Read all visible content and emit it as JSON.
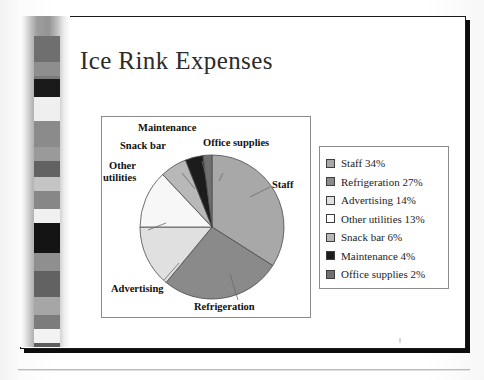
{
  "page": {
    "kind": "scanned-book-page",
    "slide_title": "Ice Rink Expenses"
  },
  "chart_data": {
    "type": "pie",
    "title": "Ice Rink Expenses",
    "xlabel": "",
    "ylabel": "",
    "legend_position": "right",
    "grid": false,
    "categories": [
      "Staff",
      "Refrigeration",
      "Advertising",
      "Other utilities",
      "Snack bar",
      "Maintenance",
      "Office supplies"
    ],
    "values": [
      34,
      27,
      14,
      13,
      6,
      4,
      2
    ],
    "unit": "%",
    "start_angle_deg": 0,
    "direction": "clockwise",
    "colors": [
      "#a8a8a8",
      "#8a8a8a",
      "#e0e0e0",
      "#f7f7f7",
      "#b8b8b8",
      "#1c1c1c",
      "#707070"
    ],
    "callout_labels": [
      {
        "text": "Staff",
        "slice": "Staff"
      },
      {
        "text": "Refrigeration",
        "slice": "Refrigeration"
      },
      {
        "text": "Advertising",
        "slice": "Advertising"
      },
      {
        "text": "Other utilities",
        "slice": "Other utilities",
        "line1": "Other",
        "line2": "utilities"
      },
      {
        "text": "Snack bar",
        "slice": "Snack bar"
      },
      {
        "text": "Maintenance",
        "slice": "Maintenance"
      },
      {
        "text": "Office supplies",
        "slice": "Office supplies"
      }
    ]
  },
  "legend": {
    "items": [
      {
        "label": "Staff 34%",
        "color": "#a8a8a8"
      },
      {
        "label": "Refrigeration 27%",
        "color": "#8a8a8a"
      },
      {
        "label": "Advertising 14%",
        "color": "#e0e0e0"
      },
      {
        "label": "Other utilities 13%",
        "color": "#fdfdfd"
      },
      {
        "label": "Snack bar 6%",
        "color": "#b8b8b8"
      },
      {
        "label": "Maintenance 4%",
        "color": "#1c1c1c"
      },
      {
        "label": "Office supplies 2%",
        "color": "#707070"
      }
    ]
  },
  "pie_labels": {
    "maintenance": "Maintenance",
    "snack_bar": "Snack bar",
    "office_supplies": "Office supplies",
    "other_l1": "Other",
    "other_l2": "utilities",
    "staff": "Staff",
    "advertising": "Advertising",
    "refrigeration": "Refrigeration"
  },
  "filmstrip": {
    "blocks": [
      {
        "top": 20,
        "height": 26,
        "color": "#6f6f6f"
      },
      {
        "top": 46,
        "height": 14,
        "color": "#8e8e8e"
      },
      {
        "top": 60,
        "height": 10,
        "color": "#7b7b7b"
      },
      {
        "top": 50,
        "height": 0,
        "color": "#8e8e8e"
      },
      {
        "top": 63,
        "height": 18,
        "color": "#1a1a1a"
      },
      {
        "top": 81,
        "height": 24,
        "color": "#efefef"
      },
      {
        "top": 105,
        "height": 26,
        "color": "#8b8b8b"
      },
      {
        "top": 131,
        "height": 14,
        "color": "#9a9a9a"
      },
      {
        "top": 145,
        "height": 16,
        "color": "#626262"
      },
      {
        "top": 161,
        "height": 14,
        "color": "#c4c4c4"
      },
      {
        "top": 175,
        "height": 18,
        "color": "#878787"
      },
      {
        "top": 193,
        "height": 14,
        "color": "#f0f0f0"
      },
      {
        "top": 207,
        "height": 30,
        "color": "#141414"
      },
      {
        "top": 237,
        "height": 18,
        "color": "#8f8f8f"
      },
      {
        "top": 255,
        "height": 26,
        "color": "#626262"
      },
      {
        "top": 281,
        "height": 18,
        "color": "#a6a6a6"
      },
      {
        "top": 299,
        "height": 14,
        "color": "#7c7c7c"
      },
      {
        "top": 313,
        "height": 14,
        "color": "#f2f2f2"
      },
      {
        "top": 327,
        "height": 22,
        "color": "#5d5d5d"
      },
      {
        "top": 349,
        "height": 20,
        "color": "#1a1a1a"
      }
    ]
  }
}
